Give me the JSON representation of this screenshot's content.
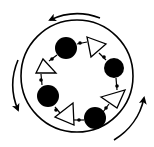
{
  "diagram": {
    "type": "ring-cycle",
    "colors": {
      "stroke": "#000000",
      "fill_node": "#000000",
      "fill_triangle": "#ffffff",
      "background": "#ffffff"
    },
    "outer_ring": {
      "cx": 77,
      "cy": 76,
      "r": 56
    },
    "rotation_arrows": [
      {
        "id": "top",
        "direction": "counterclockwise",
        "path": "M 100 18 A 64 64 0 0 0 50 20",
        "head": [
          50,
          20
        ]
      },
      {
        "id": "left",
        "direction": "counterclockwise",
        "path": "M 18 60 A 64 64 0 0 0 18 110",
        "head": [
          18,
          110
        ]
      },
      {
        "id": "bottom-right",
        "direction": "counterclockwise",
        "path": "M 114 140 A 64 64 0 0 0 144 98",
        "head": [
          144,
          98
        ]
      }
    ],
    "nodes": [
      {
        "id": "node-1",
        "cx": 66,
        "cy": 48,
        "r": 11
      },
      {
        "id": "node-2",
        "cx": 114,
        "cy": 68,
        "r": 10
      },
      {
        "id": "node-3",
        "cx": 48,
        "cy": 96,
        "r": 11
      },
      {
        "id": "node-4",
        "cx": 95,
        "cy": 118,
        "r": 11
      }
    ],
    "triangles": [
      {
        "id": "tri-1",
        "points": "87,37 106,44 91,57"
      },
      {
        "id": "tri-2",
        "points": "36,73 43,59 56,73"
      },
      {
        "id": "tri-3",
        "points": "101,97 125,90 117,108"
      },
      {
        "id": "tri-4",
        "points": "55,117 73,103 74,125"
      }
    ],
    "connectors": [
      {
        "x1": 77,
        "y1": 44,
        "x2": 87,
        "y2": 42
      },
      {
        "x1": 99,
        "y1": 53,
        "x2": 106,
        "y2": 60
      },
      {
        "x1": 116,
        "y1": 78,
        "x2": 117,
        "y2": 90
      },
      {
        "x1": 109,
        "y1": 104,
        "x2": 103,
        "y2": 112
      },
      {
        "x1": 84,
        "y1": 120,
        "x2": 74,
        "y2": 120
      },
      {
        "x1": 60,
        "y1": 113,
        "x2": 55,
        "y2": 107
      },
      {
        "x1": 42,
        "y1": 85,
        "x2": 41,
        "y2": 74
      },
      {
        "x1": 49,
        "y1": 61,
        "x2": 57,
        "y2": 55
      }
    ],
    "junction_dots": [
      {
        "cx": 80,
        "cy": 43
      },
      {
        "cx": 104,
        "cy": 57
      },
      {
        "cx": 117,
        "cy": 86
      },
      {
        "cx": 106,
        "cy": 108
      },
      {
        "cx": 79,
        "cy": 120
      },
      {
        "cx": 56,
        "cy": 110
      },
      {
        "cx": 41,
        "cy": 80
      },
      {
        "cx": 52,
        "cy": 59
      }
    ]
  }
}
